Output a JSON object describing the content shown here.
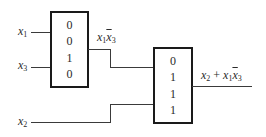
{
  "inputs": {
    "x1": {
      "name": "x",
      "sub": "1"
    },
    "x3": {
      "name": "x",
      "sub": "3"
    },
    "x2": {
      "name": "x",
      "sub": "2"
    }
  },
  "lut1": {
    "values": [
      "0",
      "0",
      "1",
      "0"
    ]
  },
  "lut2": {
    "values": [
      "0",
      "1",
      "1",
      "1"
    ]
  },
  "intermediate_output": {
    "x": "x",
    "s1": "1",
    "x2": "x",
    "s2": "3",
    "text": "x1x̄3"
  },
  "final_output": {
    "a": "x",
    "as": "2",
    "op": " + ",
    "b": "x",
    "bs": "1",
    "c": "x",
    "cs": "3",
    "text": "x2 + x1x̄3"
  }
}
